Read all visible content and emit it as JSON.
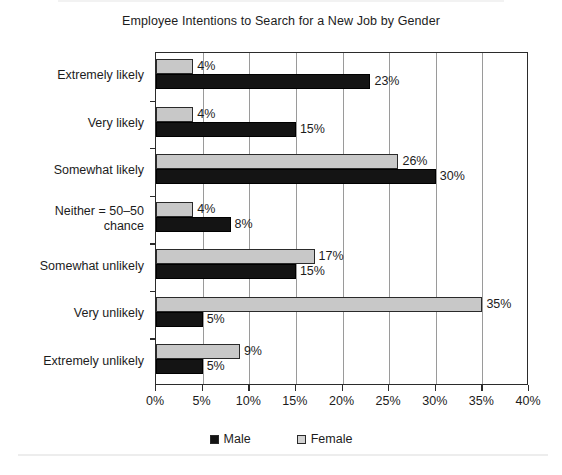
{
  "chart_data": {
    "type": "bar",
    "orientation": "horizontal",
    "title": "Employee Intentions to Search for a New Job by Gender",
    "xlabel": "",
    "ylabel": "",
    "xlim": [
      0,
      40
    ],
    "xtick_labels": [
      "0%",
      "5%",
      "10%",
      "15%",
      "20%",
      "25%",
      "30%",
      "35%",
      "40%"
    ],
    "xtick_values": [
      0,
      5,
      10,
      15,
      20,
      25,
      30,
      35,
      40
    ],
    "grid": "vertical",
    "legend_position": "bottom-center",
    "categories": [
      "Extremely likely",
      "Very likely",
      "Somewhat likely",
      "Neither = 50–50 chance",
      "Somewhat unlikely",
      "Very unlikely",
      "Extremely unlikely"
    ],
    "category_lines": [
      [
        "Extremely likely"
      ],
      [
        "Very likely"
      ],
      [
        "Somewhat likely"
      ],
      [
        "Neither = 50–50",
        "chance"
      ],
      [
        "Somewhat unlikely"
      ],
      [
        "Very unlikely"
      ],
      [
        "Extremely unlikely"
      ]
    ],
    "series": [
      {
        "name": "Male",
        "color": "#141414",
        "values": [
          23,
          15,
          30,
          8,
          15,
          5,
          5
        ],
        "labels": [
          "23%",
          "15%",
          "30%",
          "8%",
          "15%",
          "5%",
          "5%"
        ]
      },
      {
        "name": "Female",
        "color": "#c8c8c8",
        "values": [
          4,
          4,
          26,
          4,
          17,
          35,
          9
        ],
        "labels": [
          "4%",
          "4%",
          "26%",
          "4%",
          "17%",
          "35%",
          "9%"
        ]
      }
    ]
  },
  "legend": {
    "entries": [
      {
        "label": "Male",
        "swatch": "male"
      },
      {
        "label": "Female",
        "swatch": "female"
      }
    ]
  }
}
